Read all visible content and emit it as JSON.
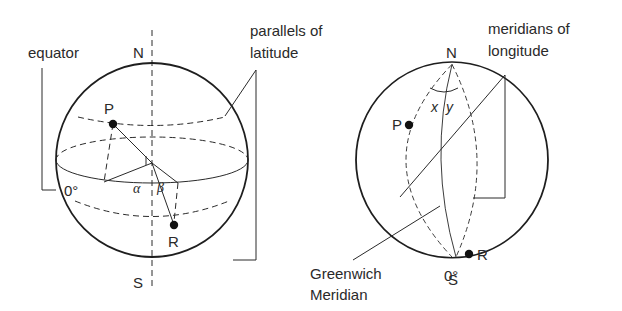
{
  "diagram": {
    "type": "geometry-diagram",
    "left_globe": {
      "labels": {
        "north": "N",
        "south": "S",
        "equator": "equator",
        "parallels_line1": "parallels of",
        "parallels_line2": "latitude",
        "zero_degrees": "0°",
        "point_p": "P",
        "point_r": "R",
        "angle_alpha": "α",
        "angle_beta": "β"
      }
    },
    "right_globe": {
      "labels": {
        "north": "N",
        "south": "S",
        "meridians_line1": "meridians of",
        "meridians_line2": "longitude",
        "greenwich_line1": "Greenwich",
        "greenwich_line2": "Meridian",
        "zero_degrees": "0°",
        "point_p": "P",
        "point_r": "R",
        "angle_x": "x",
        "angle_y": "y"
      }
    },
    "colors": {
      "line": "#1e1e1e",
      "background": "#ffffff"
    }
  }
}
